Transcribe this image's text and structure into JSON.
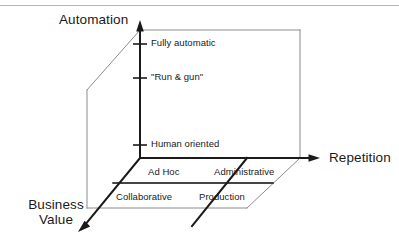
{
  "figure": {
    "kind": "3d-axes-diagram",
    "background_color": "#ffffff",
    "line_color": "#1a1a1a",
    "thin_line_color": "#8c8c8c",
    "text_color": "#1a1a1a",
    "top_rule_color": "#b3b3b3"
  },
  "axes": {
    "vertical": {
      "name": "automation-axis",
      "label": "Automation",
      "ticks": [
        {
          "label": "Fully automatic"
        },
        {
          "label": "\"Run & gun\""
        },
        {
          "label": "Human oriented"
        }
      ]
    },
    "horizontal": {
      "name": "repetition-axis",
      "label": "Repetition"
    },
    "depth": {
      "name": "business-value-axis",
      "label_line1": "Business",
      "label_line2": "Value"
    }
  },
  "floor_quadrants": {
    "back_left": "Ad Hoc",
    "back_right": "Administrative",
    "front_left": "Collaborative",
    "front_right": "Production"
  }
}
